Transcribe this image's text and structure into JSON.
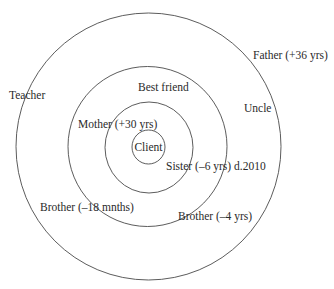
{
  "diagram": {
    "type": "concentric-relationship-circles",
    "center_label": "Client",
    "rings": [
      {
        "level": 1,
        "name": "inner-circle",
        "members": [
          "Client"
        ]
      },
      {
        "level": 2,
        "name": "second-circle",
        "members": [
          "Mother (+30 yrs)",
          "Sister (–6 yrs) d.2010"
        ]
      },
      {
        "level": 3,
        "name": "third-circle",
        "members": [
          "Best friend",
          "Brother (–18 mnths)",
          "Brother (–4 yrs)"
        ]
      },
      {
        "level": 4,
        "name": "outer-circle",
        "members": [
          "Teacher",
          "Father (+36 yrs)",
          "Uncle"
        ]
      }
    ],
    "labels": {
      "client": "Client",
      "mother": "Mother (+30 yrs)",
      "sister": "Sister (–6 yrs) d.2010",
      "best_friend": "Best friend",
      "brother_18m": "Brother (–18 mnths)",
      "brother_4y": "Brother (–4 yrs)",
      "teacher": "Teacher",
      "father": "Father (+36 yrs)",
      "uncle": "Uncle"
    },
    "stroke_color": "#4a4a4a",
    "text_color": "#2a2a2a"
  }
}
